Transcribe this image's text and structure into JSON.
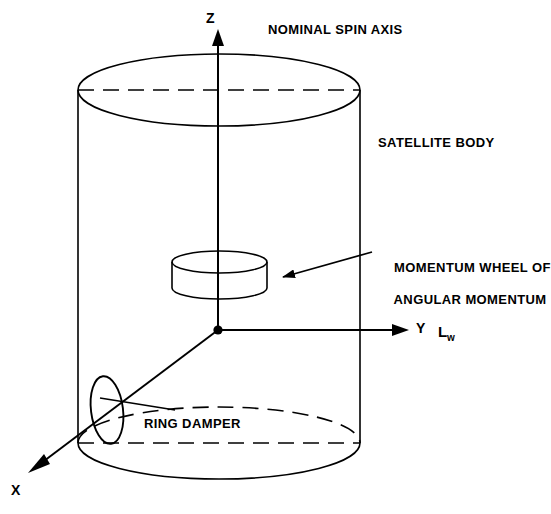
{
  "figure": {
    "background_color": "#ffffff",
    "line_color": "#000000",
    "width": 551,
    "height": 514
  },
  "axes": {
    "z": {
      "label": "Z",
      "direction": "up",
      "origin": [
        218,
        330
      ],
      "tip": [
        218,
        30
      ]
    },
    "y": {
      "label": "Y",
      "direction": "right",
      "origin": [
        218,
        330
      ],
      "tip": [
        408,
        330
      ]
    },
    "x": {
      "label": "X",
      "direction": "down-left",
      "origin": [
        218,
        330
      ],
      "tip": [
        28,
        473
      ]
    }
  },
  "labels": {
    "spin_axis": "NOMINAL SPIN AXIS",
    "satellite_body": "SATELLITE BODY",
    "momentum_wheel_line1": "MOMENTUM WHEEL OF",
    "momentum_wheel_line2": "ANGULAR MOMENTUM",
    "momentum_wheel_symbol": "L",
    "momentum_wheel_symbol_subscript": "w",
    "ring_damper": "RING DAMPER"
  },
  "components": {
    "satellite_body": {
      "name": "SATELLITE BODY",
      "shape": "cylinder",
      "left": 78,
      "right": 360,
      "top_ellipse_center_y": 90,
      "bottom_ellipse_center_y": 443,
      "ellipse_ry": 36
    },
    "momentum_wheel": {
      "name": "MOMENTUM WHEEL",
      "shape": "disk",
      "left": 172,
      "right": 267,
      "top_ellipse_center_y": 262,
      "bottom_ellipse_center_y": 288,
      "ellipse_ry": 11
    },
    "ring_damper": {
      "name": "RING DAMPER",
      "shape": "tilted-ellipse",
      "center": [
        107,
        410
      ],
      "rx": 16,
      "ry": 34,
      "rotation_deg": -8
    }
  }
}
